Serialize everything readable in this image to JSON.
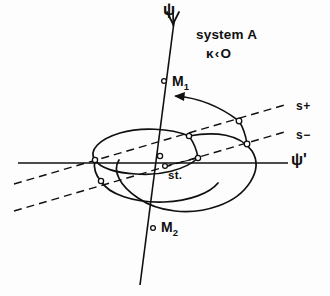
{
  "figure": {
    "width": 330,
    "height": 296,
    "background_color": "#fdfdfd",
    "ink_color": "#101010",
    "caption_block": {
      "system_label": "system A",
      "condition_label": "κ‹O"
    },
    "axes": {
      "vertical": {
        "name": "psi-axis",
        "label": "ψ",
        "label_x": 163,
        "label_y": 10,
        "x1": 174,
        "y1": 20,
        "x2": 140,
        "y2": 285,
        "arrow_head": "trident-top"
      },
      "horizontal": {
        "name": "psi-prime-axis",
        "label": "ψ'",
        "label_x": 291,
        "label_y": 152,
        "x1": 18,
        "y1": 163,
        "x2": 288,
        "y2": 163
      }
    },
    "dashed_lines": [
      {
        "name": "s-plus-line",
        "label": "s+",
        "label_x": 296,
        "label_y": 100,
        "x1": 14,
        "y1": 184,
        "x2": 288,
        "y2": 104,
        "dash": "8,5"
      },
      {
        "name": "s-minus-line",
        "label": "s−",
        "label_x": 296,
        "label_y": 129,
        "x1": 14,
        "y1": 211,
        "x2": 288,
        "y2": 131,
        "dash": "8,5"
      }
    ],
    "point_labels": [
      {
        "name": "m1-label",
        "text": "M",
        "sub": "1",
        "x": 172,
        "y": 76,
        "marker_x": 163,
        "marker_y": 81
      },
      {
        "name": "m2-label",
        "text": "M",
        "sub": "2",
        "x": 163,
        "y": 222,
        "marker_x": 153,
        "marker_y": 228
      },
      {
        "name": "st-label",
        "text": "st.",
        "x": 168,
        "y": 170,
        "marker_x": 164,
        "marker_y": 166
      }
    ],
    "node_markers": [
      {
        "name": "node-origin",
        "x": 160,
        "y": 156,
        "r": 2.6
      },
      {
        "name": "node-m1",
        "x": 164,
        "y": 81,
        "r": 2.4
      },
      {
        "name": "node-m2",
        "x": 153,
        "y": 228,
        "r": 2.4
      },
      {
        "name": "node-st",
        "x": 165,
        "y": 166,
        "r": 2.4
      },
      {
        "name": "node-inner-upper-right",
        "x": 189,
        "y": 136,
        "r": 2.6
      },
      {
        "name": "node-inner-lower-right",
        "x": 198,
        "y": 158,
        "r": 2.6
      },
      {
        "name": "node-inner-left-upper",
        "x": 95,
        "y": 160,
        "r": 2.6
      },
      {
        "name": "node-inner-left-lower",
        "x": 101,
        "y": 181,
        "r": 2.6
      },
      {
        "name": "node-outer-s-plus",
        "x": 239,
        "y": 121,
        "r": 2.8
      },
      {
        "name": "node-outer-s-minus",
        "x": 247,
        "y": 144,
        "r": 2.8
      }
    ],
    "curves": [
      {
        "name": "inner-ellipse-curve",
        "description": "tilted closed loop around the origin, flattened near right side"
      },
      {
        "name": "outer-separatrix-curve",
        "description": "large outer arc bulging to the right and sweeping down-left"
      },
      {
        "name": "inner-right-chord",
        "description": "short near-vertical segment joining the two inner right nodes"
      },
      {
        "name": "outer-right-chord",
        "description": "short segment joining the two outer right nodes"
      }
    ],
    "arrow": {
      "name": "rotation-arrow",
      "description": "curved arrow from the s+ outer node sweeping up-left toward M1",
      "tip_x": 174,
      "tip_y": 96
    }
  }
}
